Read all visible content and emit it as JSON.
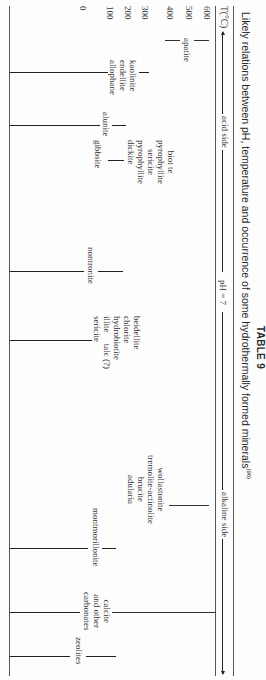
{
  "table": {
    "number": "TABLE 9",
    "caption": "Likely relations between pH, temperature and occurrence of some hydrothermally formed minerals",
    "caption_ref": "(96)"
  },
  "axis": {
    "temp_label": "T(°C)",
    "acid_side": "acid side",
    "ph_neutral": "pH = 7",
    "alkaline_side": "alkaline side",
    "temperatures": [
      "600",
      "500",
      "400",
      "300",
      "200",
      "100",
      "0"
    ]
  },
  "minerals": {
    "apatite": "apatite",
    "biotite_group": [
      "biot te",
      "pyrophyllite",
      "sericite"
    ],
    "kaolin_group": [
      "kaolinite",
      "endellite",
      "allophane"
    ],
    "alunite": "alunite",
    "pyrophyllite_dickite": [
      "pyrophyllite",
      "dickite"
    ],
    "gibbsite": "gibbsite",
    "nontronite": "nontronite",
    "beidellite_group": [
      "beidellite",
      "chlorite",
      "hydrobiotite",
      "illite     talc (?)",
      "sericite"
    ],
    "wollastonite_group": [
      "wollastonite",
      "tremolite-actinolite",
      "brucite",
      "adularia"
    ],
    "montmorillonite": "montmorillonite",
    "carbonates": [
      "calcite",
      "and other",
      "carbonates"
    ],
    "zeolites": "zeolites"
  }
}
